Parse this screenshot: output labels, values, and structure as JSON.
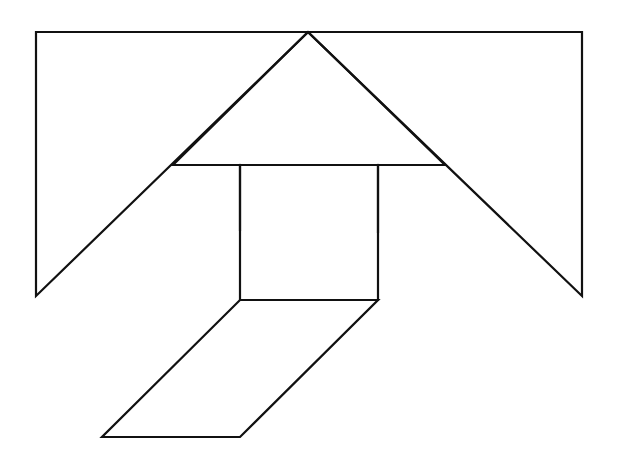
{
  "diagram": {
    "type": "tangram-figure",
    "background": "#ffffff",
    "stroke_color": "#111111",
    "pieces": [
      {
        "name": "left-large-triangle",
        "shape": "triangle",
        "points": "36,32 308,32 36,296"
      },
      {
        "name": "right-large-triangle",
        "shape": "triangle",
        "points": "308,32 582,32 582,296"
      },
      {
        "name": "center-medium-triangle",
        "shape": "triangle",
        "points": "308,32 445,165 173,165"
      },
      {
        "name": "left-small-triangle",
        "shape": "triangle",
        "points": "173,165 240,165 240,230"
      },
      {
        "name": "right-small-triangle",
        "shape": "triangle",
        "points": "378,165 445,165 378,232"
      },
      {
        "name": "square",
        "shape": "square",
        "points": "240,165 378,165 378,300 240,300"
      },
      {
        "name": "parallelogram",
        "shape": "parallelogram",
        "points": "240,300 378,300 240,437 102,437"
      }
    ]
  }
}
